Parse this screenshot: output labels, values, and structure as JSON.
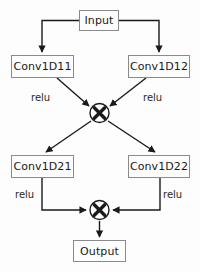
{
  "diagram": {
    "background_color": "#fdfdfd",
    "stroke_color": "#1a1a1a",
    "box_border_color": "#8a8a8a",
    "text_color": "#1a1a1a",
    "nodes": [
      {
        "id": "input",
        "label": "Input",
        "x": 79,
        "y": 10,
        "w": 40,
        "h": 21
      },
      {
        "id": "conv1d11",
        "label": "Conv1D11",
        "x": 11,
        "y": 55,
        "w": 63,
        "h": 23
      },
      {
        "id": "conv1d12",
        "label": "Conv1D12",
        "x": 128,
        "y": 55,
        "w": 62,
        "h": 23
      },
      {
        "id": "conv1d21",
        "label": "Conv1D21",
        "x": 11,
        "y": 155,
        "w": 63,
        "h": 23
      },
      {
        "id": "conv1d22",
        "label": "Conv1D22",
        "x": 128,
        "y": 155,
        "w": 62,
        "h": 23
      },
      {
        "id": "output",
        "label": "Output",
        "x": 73,
        "y": 240,
        "w": 53,
        "h": 22
      }
    ],
    "operators": [
      {
        "id": "multiply-top",
        "symbol": "⊗",
        "icon": "multiply-circle-icon",
        "cx": 99,
        "cy": 113,
        "r": 10
      },
      {
        "id": "multiply-bottom",
        "symbol": "⊗",
        "icon": "multiply-circle-icon",
        "cx": 99,
        "cy": 210,
        "r": 10
      }
    ],
    "edge_labels": [
      {
        "id": "relu-11",
        "text": "relu",
        "x": 31,
        "y": 93
      },
      {
        "id": "relu-12",
        "text": "relu",
        "x": 143,
        "y": 93
      },
      {
        "id": "relu-21",
        "text": "relu",
        "x": 15,
        "y": 190
      },
      {
        "id": "relu-22",
        "text": "relu",
        "x": 163,
        "y": 190
      }
    ],
    "connections": [
      {
        "from": "input",
        "to": "conv1d11",
        "label": ""
      },
      {
        "from": "input",
        "to": "conv1d12",
        "label": ""
      },
      {
        "from": "conv1d11",
        "to": "multiply-top",
        "label": "relu"
      },
      {
        "from": "conv1d12",
        "to": "multiply-top",
        "label": "relu"
      },
      {
        "from": "multiply-top",
        "to": "conv1d21",
        "label": ""
      },
      {
        "from": "multiply-top",
        "to": "conv1d22",
        "label": ""
      },
      {
        "from": "conv1d21",
        "to": "multiply-bottom",
        "label": "relu"
      },
      {
        "from": "conv1d22",
        "to": "multiply-bottom",
        "label": "relu"
      },
      {
        "from": "multiply-bottom",
        "to": "output",
        "label": ""
      }
    ]
  }
}
